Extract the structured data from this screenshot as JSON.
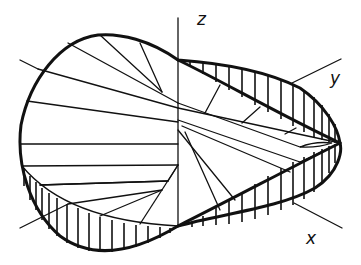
{
  "figure": {
    "axes": {
      "z_label": "z",
      "y_label": "y",
      "x_label": "x"
    },
    "colors": {
      "stroke": "#111111",
      "background": "#ffffff"
    }
  }
}
